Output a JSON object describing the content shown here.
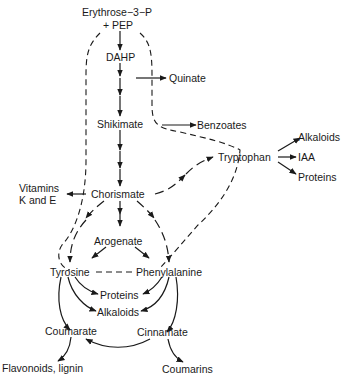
{
  "diagram": {
    "nodes": {
      "erythrose": "Erythrose−3−P",
      "pep": "+ PEP",
      "dahp": "DAHP",
      "quinate": "Quinate",
      "shikimate": "Shikimate",
      "benzoates": "Benzoates",
      "tryptophan": "Tryptophan",
      "alkaloids_trp": "Alkaloids",
      "iaa": "IAA",
      "proteins_trp": "Proteins",
      "vitamins_line1": "Vitamins",
      "vitamins_line2": "K and E",
      "chorismate": "Chorismate",
      "arogenate": "Arogenate",
      "tyrosine": "Tyrosine",
      "phenylalanine": "Phenylalanine",
      "proteins": "Proteins",
      "alkaloids": "Alkaloids",
      "coumarate": "Coumarate",
      "cinnamate": "Cinnamate",
      "flavonoids": "Flavonoids, lignin",
      "coumarins": "Coumarins"
    },
    "edges": [
      {
        "from": "Erythrose-3-P + PEP",
        "to": "DAHP",
        "style": "solid"
      },
      {
        "from": "DAHP",
        "to": "Shikimate",
        "style": "multi-step solid"
      },
      {
        "from": "DAHP branch",
        "to": "Quinate",
        "style": "solid"
      },
      {
        "from": "Shikimate",
        "to": "Benzoates",
        "style": "solid"
      },
      {
        "from": "Shikimate",
        "to": "Chorismate",
        "style": "multi-step solid"
      },
      {
        "from": "Chorismate",
        "to": "Vitamins K and E",
        "style": "solid"
      },
      {
        "from": "Chorismate",
        "to": "Tryptophan",
        "style": "multi-step dashed"
      },
      {
        "from": "Chorismate",
        "to": "Arogenate",
        "style": "multi-step solid"
      },
      {
        "from": "Chorismate",
        "to": "Tyrosine",
        "style": "multi-step dashed"
      },
      {
        "from": "Chorismate",
        "to": "Phenylalanine",
        "style": "multi-step dashed"
      },
      {
        "from": "Arogenate",
        "to": "Tyrosine",
        "style": "solid"
      },
      {
        "from": "Arogenate",
        "to": "Phenylalanine",
        "style": "solid"
      },
      {
        "from": "Tryptophan",
        "to": "Alkaloids",
        "style": "solid"
      },
      {
        "from": "Tryptophan",
        "to": "IAA",
        "style": "solid"
      },
      {
        "from": "Tryptophan",
        "to": "Proteins",
        "style": "solid"
      },
      {
        "from": "Tyrosine",
        "to": "Proteins",
        "style": "solid"
      },
      {
        "from": "Tyrosine",
        "to": "Alkaloids",
        "style": "solid"
      },
      {
        "from": "Tyrosine",
        "to": "Coumarate",
        "style": "solid"
      },
      {
        "from": "Phenylalanine",
        "to": "Proteins",
        "style": "solid"
      },
      {
        "from": "Phenylalanine",
        "to": "Alkaloids",
        "style": "solid"
      },
      {
        "from": "Phenylalanine",
        "to": "Cinnamate",
        "style": "solid"
      },
      {
        "from": "Cinnamate",
        "to": "Coumarate",
        "style": "solid"
      },
      {
        "from": "Coumarate",
        "to": "Flavonoids, lignin",
        "style": "solid"
      },
      {
        "from": "Cinnamate",
        "to": "Coumarins",
        "style": "solid"
      },
      {
        "from": "Tyrosine",
        "to": "Phenylalanine",
        "style": "dashed link"
      }
    ],
    "feedback_loops": [
      {
        "description": "dashed loop from Tyrosine back to Erythrose-3-P + PEP"
      },
      {
        "description": "dashed loop from Phenylalanine / Tryptophan back to Erythrose-3-P + PEP"
      }
    ]
  }
}
